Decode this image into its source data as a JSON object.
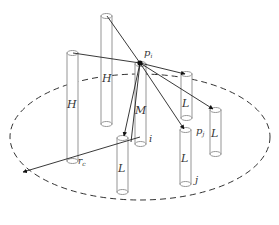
{
  "diagram": {
    "type": "3d-schematic",
    "boundary": {
      "shape": "dashed-ellipse",
      "radius_label": "r",
      "radius_subscript": "c"
    },
    "center_point": {
      "label": "p",
      "subscript": "i"
    },
    "neighbor_point": {
      "label": "p",
      "subscript": "j"
    },
    "index_labels": {
      "center": "i",
      "neighbor": "j"
    },
    "cylinders": [
      {
        "id": "h-back",
        "label": "H"
      },
      {
        "id": "h-mid",
        "label": "H"
      },
      {
        "id": "h-left",
        "label": "H"
      },
      {
        "id": "m-center",
        "label": "M"
      },
      {
        "id": "l-right-top",
        "label": "L"
      },
      {
        "id": "l-right-far",
        "label": "L"
      },
      {
        "id": "l-front-left",
        "label": "L"
      },
      {
        "id": "l-front-mid",
        "label": "L"
      }
    ]
  }
}
